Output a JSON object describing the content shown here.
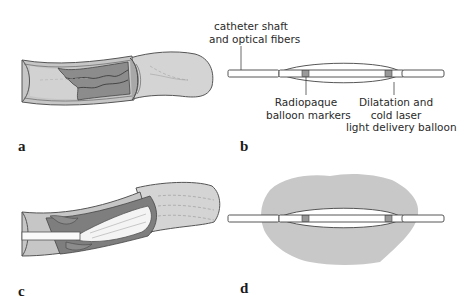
{
  "figure": {
    "panels": [
      {
        "id": "a",
        "label": "a",
        "description": "Artery cross-section with atherosclerotic plaque"
      },
      {
        "id": "b",
        "label": "b",
        "description": "Balloon catheter with optical fibers"
      },
      {
        "id": "c",
        "label": "c",
        "description": "Catheter balloon inflated inside plaque-narrowed artery"
      },
      {
        "id": "d",
        "label": "d",
        "description": "Balloon emitting cold laser light"
      }
    ],
    "annotations": {
      "catheter_line1": "catheter shaft",
      "catheter_line2": "and optical fibers",
      "markers_line1": "Radiopaque",
      "markers_line2": "balloon markers",
      "balloon_line1": "Dilatation and",
      "balloon_line2": "cold laser",
      "balloon_line3": "light delivery balloon"
    },
    "colors": {
      "vessel_wall": "#c4c4c4",
      "vessel_lumen": "#d6d6d6",
      "plaque": "#8a8a8a",
      "outline": "#444444",
      "light_glow": "#c8c8c8",
      "catheter": "#ffffff"
    }
  }
}
